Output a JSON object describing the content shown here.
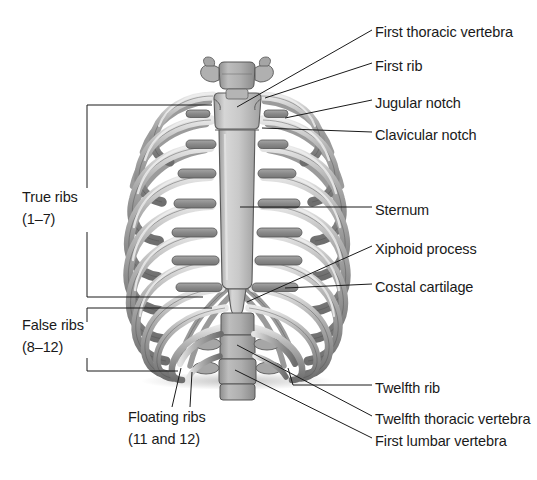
{
  "figure": {
    "background_color": "#ffffff",
    "text_color": "#1a1a1a",
    "leader_color": "#1a1a1a",
    "bone_color": "#9a9a9a",
    "bone_highlight": "#f2f2f2",
    "bone_outline": "#4a4a4a",
    "sternum_color": "#c6c6c6",
    "cartilage_color": "#8c8c8c",
    "vertebra_color": "#a8a8a8"
  },
  "labels": {
    "first_thoracic_vertebra": "First thoracic vertebra",
    "first_rib": "First rib",
    "jugular_notch": "Jugular notch",
    "clavicular_notch": "Clavicular notch",
    "sternum": "Sternum",
    "xiphoid_process": "Xiphoid process",
    "costal_cartilage": "Costal cartilage",
    "twelfth_rib": "Twelfth rib",
    "twelfth_thoracic_vertebra": "Twelfth thoracic vertebra",
    "first_lumbar_vertebra": "First lumbar vertebra",
    "true_ribs_name": "True ribs",
    "true_ribs_range": "(1–7)",
    "false_ribs_name": "False ribs",
    "false_ribs_range": "(8–12)",
    "floating_ribs_name": "Floating ribs",
    "floating_ribs_range": "(11 and 12)"
  },
  "brackets": {
    "true_ribs": {
      "label": "True ribs (1–7)",
      "rib_range": [
        1,
        7
      ]
    },
    "false_ribs": {
      "label": "False ribs (8–12)",
      "rib_range": [
        8,
        12
      ]
    },
    "floating_ribs": {
      "label": "Floating ribs (11 and 12)",
      "rib_range": [
        11,
        12
      ]
    }
  },
  "anatomy": {
    "rib_pairs": 12,
    "true_rib_pairs": 7,
    "false_rib_pairs": 5,
    "floating_rib_pairs": 2,
    "sternum_parts": [
      "manubrium",
      "body",
      "xiphoid process"
    ],
    "vertebrae_shown": [
      "first thoracic vertebra",
      "twelfth thoracic vertebra",
      "first lumbar vertebra"
    ]
  }
}
